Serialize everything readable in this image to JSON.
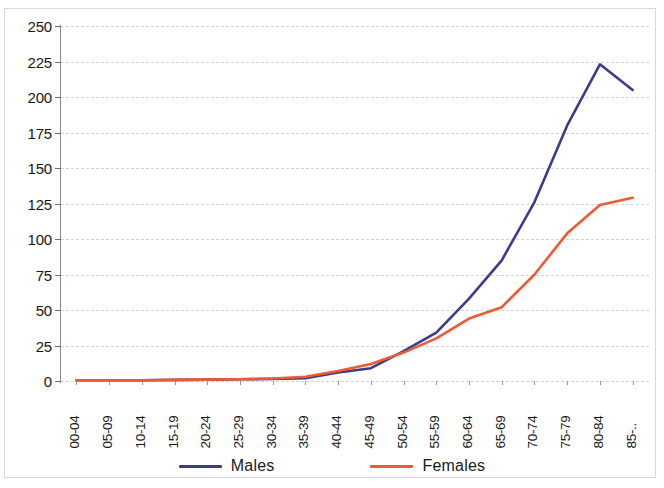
{
  "chart_data": {
    "type": "line",
    "title": "",
    "subtitle": "",
    "xlabel": "",
    "ylabel": "",
    "grid": true,
    "legend_position": "bottom",
    "ylim": [
      0,
      250
    ],
    "y_ticks": [
      0,
      25,
      50,
      75,
      100,
      125,
      150,
      175,
      200,
      225,
      250
    ],
    "categories": [
      "00-04",
      "05-09",
      "10-14",
      "15-19",
      "20-24",
      "25-29",
      "30-34",
      "35-39",
      "40-44",
      "45-49",
      "50-54",
      "55-59",
      "60-64",
      "65-69",
      "70-74",
      "75-79",
      "80-84",
      "85-.."
    ],
    "series": [
      {
        "name": "Males",
        "color": "#3b3b8c",
        "values": [
          0.5,
          0.5,
          0.5,
          0.8,
          1,
          1.2,
          1.5,
          2,
          6,
          9,
          21,
          34,
          58,
          85,
          126,
          180,
          223,
          205
        ]
      },
      {
        "name": "Females",
        "color": "#ed5a33",
        "values": [
          0.5,
          0.5,
          0.5,
          0.8,
          1,
          1.2,
          1.8,
          3,
          7,
          12,
          20,
          30,
          44,
          52,
          75,
          104,
          124,
          129
        ]
      }
    ]
  },
  "legend": {
    "items": [
      {
        "label": "Males",
        "color": "#3b3b8c"
      },
      {
        "label": "Females",
        "color": "#ed5a33"
      }
    ]
  }
}
